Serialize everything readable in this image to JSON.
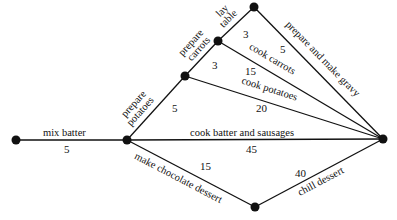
{
  "diagram": {
    "type": "activity-network",
    "nodes": [
      {
        "id": "start",
        "x": 16,
        "y": 140
      },
      {
        "id": "n1",
        "x": 127,
        "y": 140
      },
      {
        "id": "n2",
        "x": 185,
        "y": 76
      },
      {
        "id": "n3",
        "x": 218,
        "y": 41
      },
      {
        "id": "n4",
        "x": 254,
        "y": 7
      },
      {
        "id": "end",
        "x": 383,
        "y": 139
      },
      {
        "id": "n5",
        "x": 255,
        "y": 207
      }
    ],
    "edges": [
      {
        "from": "start",
        "to": "n1",
        "activity": "mix batter",
        "duration": "5"
      },
      {
        "from": "n1",
        "to": "n2",
        "activity": "prepare potatoes",
        "activity_line1": "prepare",
        "activity_line2": "potatoes",
        "duration": "5"
      },
      {
        "from": "n2",
        "to": "n3",
        "activity": "prepare carrots",
        "activity_line1": "prepare",
        "activity_line2": "carrots",
        "duration": "3"
      },
      {
        "from": "n3",
        "to": "n4",
        "activity": "lay table",
        "activity_line1": "lay",
        "activity_line2": "table",
        "duration": "3"
      },
      {
        "from": "n4",
        "to": "end",
        "activity": "prepare and make gravy",
        "duration": "5"
      },
      {
        "from": "n3",
        "to": "end",
        "activity": "cook carrots",
        "duration": "15"
      },
      {
        "from": "n2",
        "to": "end",
        "activity": "cook potatoes",
        "duration": "20"
      },
      {
        "from": "n1",
        "to": "end",
        "activity": "cook batter and sausages",
        "duration": "45"
      },
      {
        "from": "n1",
        "to": "n5",
        "activity": "make chocolate dessert",
        "duration": "15"
      },
      {
        "from": "n5",
        "to": "end",
        "activity": "chill dessert",
        "duration": "40"
      }
    ]
  }
}
